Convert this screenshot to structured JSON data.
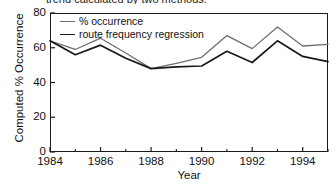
{
  "caption": {
    "text": "trend calculated by two methods."
  },
  "chart_data": {
    "type": "line",
    "title": "",
    "xlabel": "Year",
    "ylabel": "Computed % Occurrence",
    "xlim": [
      1984,
      1995
    ],
    "ylim": [
      0,
      80
    ],
    "grid": false,
    "legend_position": "top-left-inside",
    "x": [
      1984,
      1985,
      1986,
      1987,
      1988,
      1989,
      1990,
      1991,
      1992,
      1993,
      1994,
      1995
    ],
    "xticks": [
      1984,
      1986,
      1988,
      1990,
      1992,
      1994
    ],
    "xticklabels": [
      "1984",
      "1986",
      "1988",
      "1990",
      "1992",
      "1994"
    ],
    "xminorticks": [
      1985,
      1987,
      1989,
      1991,
      1993,
      1995
    ],
    "yticks": [
      0,
      20,
      40,
      60,
      80
    ],
    "yticklabels": [
      "0",
      "20",
      "40",
      "60",
      "80"
    ],
    "series": [
      {
        "name": "% occurrence",
        "color": "#6e6e6e",
        "values": [
          64,
          59,
          65.5,
          57,
          48,
          51,
          54.5,
          67,
          59.5,
          72,
          61,
          62
        ]
      },
      {
        "name": "route frequency regression",
        "color": "#1a1a1a",
        "values": [
          64,
          56,
          61.5,
          54,
          48,
          49,
          49.5,
          58,
          51.5,
          64,
          55,
          52
        ]
      }
    ]
  }
}
